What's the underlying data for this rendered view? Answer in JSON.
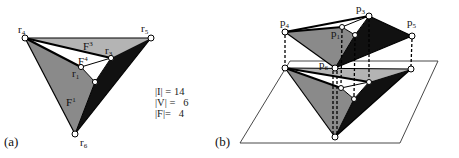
{
  "panel_a": {
    "label": "(a)",
    "vertex_labels": {
      "r4": "r",
      "r4_sub": "4",
      "r5": "r",
      "r5_sub": "5",
      "r3": "r",
      "r3_sub": "3",
      "r1": "r",
      "r1_sub": "1",
      "r6": "r",
      "r6_sub": "6"
    },
    "face_labels": {
      "f1": "F",
      "f1_sup": "1",
      "f3": "F",
      "f3_sup": "3",
      "f4": "F",
      "f4_sup": "4"
    },
    "stats": [
      {
        "label": "|I|",
        "eq": "=",
        "value": "14"
      },
      {
        "label": "|V|",
        "eq": "=",
        "value": "6"
      },
      {
        "label": "|F|",
        "eq": "=",
        "value": "4"
      }
    ]
  },
  "panel_b": {
    "label": "(b)",
    "vertex_labels": {
      "p4": "p",
      "p4_sub": "4",
      "p3": "p",
      "p3_sub": "3",
      "p5": "p",
      "p5_sub": "5",
      "p1": "p",
      "p1_sub": "1",
      "p6": "p",
      "p6_sub": "6"
    }
  },
  "colors": {
    "light_gray": "#b4b4b4",
    "mid_gray": "#8a8a8a",
    "dark": "#111111",
    "line": "#000000"
  }
}
